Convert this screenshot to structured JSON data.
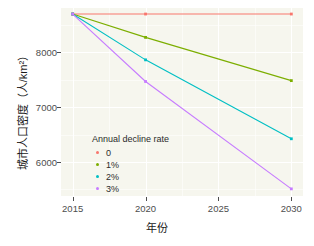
{
  "chart_data": {
    "type": "line",
    "title": "",
    "xlabel": "年份",
    "ylabel": "城市人口密度（人/km²）",
    "x": [
      2015,
      2020,
      2030
    ],
    "xlim": [
      2014.2,
      2030.8
    ],
    "ylim": [
      5380,
      8810
    ],
    "xticks": [
      2015,
      2020,
      2025,
      2030
    ],
    "xticklabels": [
      "2015",
      "2020",
      "2025",
      "2030"
    ],
    "yticks": [
      6000,
      7000,
      8000
    ],
    "yticklabels": [
      "6000",
      "7000",
      "8000"
    ],
    "grid": true,
    "legend_position": "inside-bottom-left",
    "legend_title": "Annual decline rate",
    "series": [
      {
        "name": "0",
        "color": "#f8766d",
        "values": [
          8700,
          8700,
          8700
        ]
      },
      {
        "name": "1%",
        "color": "#7cae00",
        "values": [
          8700,
          8274,
          7485
        ]
      },
      {
        "name": "2%",
        "color": "#00bfc4",
        "values": [
          8700,
          7864,
          6424
        ]
      },
      {
        "name": "3%",
        "color": "#c77cff",
        "values": [
          8700,
          7469,
          5510
        ]
      }
    ]
  },
  "axes": {
    "xlabel": "年份",
    "ylabel": "城市人口密度（人/km²）",
    "xticklabels": [
      "2015",
      "2020",
      "2025",
      "2030"
    ],
    "yticklabels": [
      "8000",
      "7000",
      "6000"
    ]
  },
  "legend": {
    "title": "Annual decline rate",
    "items": [
      {
        "label": "0",
        "color": "#f8766d"
      },
      {
        "label": "1%",
        "color": "#7cae00"
      },
      {
        "label": "2%",
        "color": "#00bfc4"
      },
      {
        "label": "3%",
        "color": "#c77cff"
      }
    ]
  },
  "colors": {
    "panel_background": "#f6f6ee",
    "grid": "#ffffff",
    "page_background": "#ffffff",
    "text": "#1a1a1a",
    "tick_text": "#4d4d4d"
  }
}
